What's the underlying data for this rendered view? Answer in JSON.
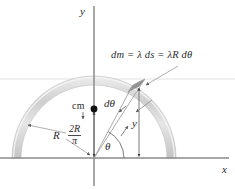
{
  "figure": {
    "axes": {
      "x_label": "x",
      "y_label": "y"
    },
    "labels": {
      "mass_element": "dm = λ ds = λR dθ",
      "center_of_mass": "cm",
      "cm_distance_numerator": "2R",
      "cm_distance_denominator": "π",
      "radius": "R",
      "angle": "θ",
      "angle_increment": "dθ",
      "height": "y"
    },
    "colors": {
      "ring_light": "#d2d2d2",
      "ring_highlight": "#f2f2f2",
      "ring_segment": "#9a9a9a",
      "axis": "#8a8a8a",
      "leader": "#9b9b9b",
      "text": "#2b2b2b",
      "dot": "#111111",
      "background": "#ffffff"
    },
    "geometry": {
      "origin_x": 94,
      "origin_y": 158,
      "radius_px": 82,
      "ring_thickness_px": 9,
      "theta_deg": 62,
      "dtheta_deg": 9,
      "cm_y": 109
    }
  }
}
